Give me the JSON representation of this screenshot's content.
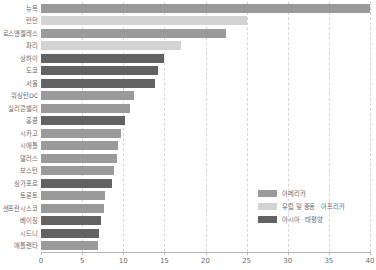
{
  "chart_data": {
    "type": "bar",
    "orientation": "horizontal",
    "title": "",
    "xlabel": "",
    "ylabel": "",
    "xlim": [
      0,
      40
    ],
    "xticks": [
      "0",
      "5",
      "10",
      "15",
      "20",
      "25",
      "30",
      "35",
      "40"
    ],
    "grid": true,
    "legend_position": "bottom-right",
    "categories": [
      "뉴욕",
      "런던",
      "로스앤젤레스",
      "파리",
      "상하이",
      "도쿄",
      "서울",
      "워싱턴DC",
      "실리콘밸리",
      "홍콩",
      "시카고",
      "시애틀",
      "댈러스",
      "보스턴",
      "싱가포르",
      "토론토",
      "샌프란시스코",
      "베이징",
      "시드니",
      "애틀랜타"
    ],
    "values": [
      40.0,
      25.0,
      22.5,
      17.0,
      15.0,
      14.2,
      13.8,
      11.3,
      10.8,
      10.2,
      9.7,
      9.4,
      9.2,
      8.9,
      8.6,
      7.8,
      7.6,
      7.3,
      7.1,
      6.9
    ],
    "groups": [
      "아메리카",
      "유럽 및 중동 · 아프리카",
      "아메리카",
      "유럽 및 중동 · 아프리카",
      "아시아 · 태평양",
      "아시아 · 태평양",
      "아시아 · 태평양",
      "아메리카",
      "아메리카",
      "아시아 · 태평양",
      "아메리카",
      "아메리카",
      "아메리카",
      "아메리카",
      "아시아 · 태평양",
      "아메리카",
      "아메리카",
      "아시아 · 태평양",
      "아시아 · 태평양",
      "아메리카"
    ],
    "legend": [
      {
        "label": "아메리카",
        "color": "#9a9a9a"
      },
      {
        "label": "유럽 및 중동 · 아프리카",
        "color": "#d3d3d3"
      },
      {
        "label": "아시아 · 태평양",
        "color": "#626262"
      }
    ],
    "colors": {
      "americas": "#9a9a9a",
      "emea": "#d3d3d3",
      "apac": "#626262",
      "gridline": "#d6d6d6",
      "axis": "#b5b5b5",
      "text": "#6b6b6b"
    }
  }
}
